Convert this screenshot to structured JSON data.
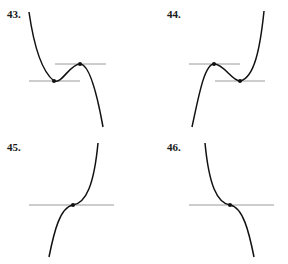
{
  "panels": [
    {
      "label": "43.",
      "description": "Cubic with negative leading coefficient: local minimum then local maximum, horizontal tangent lines at both",
      "critical_points": [
        "local-min",
        "local-max"
      ]
    },
    {
      "label": "44.",
      "description": "Cubic with positive leading coefficient: local maximum then local minimum, horizontal tangent lines at both",
      "critical_points": [
        "local-max",
        "local-min"
      ]
    },
    {
      "label": "45.",
      "description": "Increasing cubic with horizontal tangent at inflection point",
      "critical_points": [
        "inflection-horizontal-tangent"
      ]
    },
    {
      "label": "46.",
      "description": "Decreasing cubic with horizontal tangent at inflection point",
      "critical_points": [
        "inflection-horizontal-tangent"
      ]
    }
  ],
  "colors": {
    "curve": "#111111",
    "tangent_line": "#9a9a9a",
    "point": "#111111",
    "label": "#1a1a1a"
  }
}
